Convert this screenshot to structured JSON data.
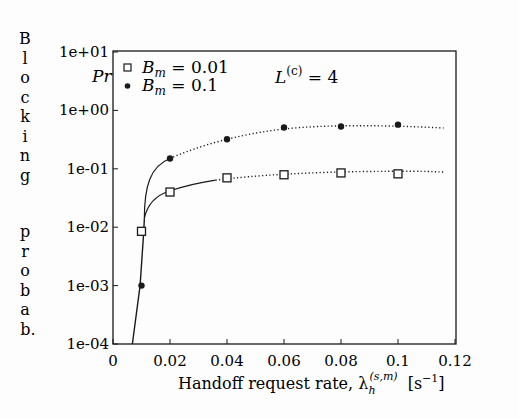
{
  "chart_data": {
    "type": "line",
    "title": "",
    "xlabel": "Handoff request rate, λ_h^(s,m) [s^-1]",
    "xlabel_parts": {
      "main": "Handoff request rate, λ",
      "sub": "h",
      "sup": "(s,m)",
      "unit_open": "[s",
      "unit_sup": "−1",
      "unit_close": "]"
    },
    "ylabel": "Blocking probab.",
    "ylabel_letters_top": [
      "B",
      "l",
      "o",
      "c",
      "k",
      "i",
      "n",
      "g"
    ],
    "ylabel_letters_bottom": [
      "p",
      "r",
      "o",
      "b",
      "a",
      "b."
    ],
    "pr_label": "Pr",
    "annotation": {
      "text": "L",
      "sup": "(c)",
      "rest": " =  4"
    },
    "xlim": [
      0,
      0.12
    ],
    "ylim": [
      0.0001,
      10
    ],
    "yscale": "log",
    "x_ticks": [
      0,
      0.02,
      0.04,
      0.06,
      0.08,
      0.1,
      0.12
    ],
    "x_tick_labels": [
      "0",
      "0.02",
      "0.04",
      "0.06",
      "0.08",
      "0.1",
      "0.12"
    ],
    "y_ticks": [
      10,
      1,
      0.1,
      0.01,
      0.001,
      0.0001
    ],
    "y_tick_labels": [
      "1e+01",
      "1e+00",
      "1e-01",
      "1e-02",
      "1e-03",
      "1e-04"
    ],
    "grid": false,
    "legend_position": "upper left (inside)",
    "series": [
      {
        "name": "B_m = 0.01",
        "legend_label": "B",
        "legend_sub": "m",
        "legend_value": " = 0.01",
        "marker": "open-square",
        "x": [
          0.01,
          0.02,
          0.04,
          0.06,
          0.08,
          0.1
        ],
        "values": [
          0.0085,
          0.04,
          0.07,
          0.079,
          0.085,
          0.082
        ]
      },
      {
        "name": "B_m = 0.1",
        "legend_label": "B",
        "legend_sub": "m",
        "legend_value": " = 0.1",
        "marker": "filled-circle",
        "x": [
          0.01,
          0.02,
          0.04,
          0.06,
          0.08,
          0.1
        ],
        "values": [
          0.001,
          0.15,
          0.32,
          0.51,
          0.53,
          0.57
        ]
      }
    ]
  },
  "colors": {
    "ink": "#1a1a1a",
    "background": "#fdfdfd"
  }
}
